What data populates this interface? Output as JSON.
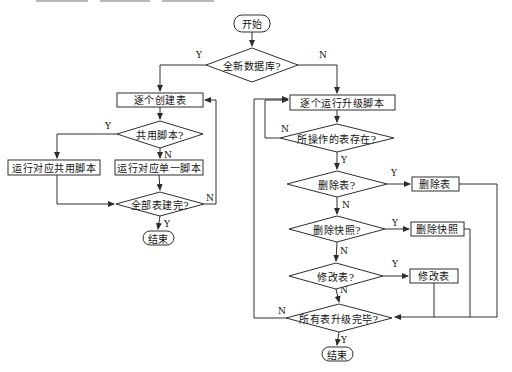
{
  "diagram": {
    "type": "flowchart",
    "nodes": {
      "start": {
        "label": "开始",
        "shape": "terminator"
      },
      "new_db": {
        "label": "全新数据库?",
        "shape": "decision"
      },
      "create_tables": {
        "label": "逐个创建表",
        "shape": "process"
      },
      "shared_script": {
        "label": "共用脚本?",
        "shape": "decision"
      },
      "run_shared": {
        "label": "运行对应共用脚本",
        "shape": "process"
      },
      "run_single": {
        "label": "运行对应单一脚本",
        "shape": "process"
      },
      "all_created": {
        "label": "全部表建完?",
        "shape": "decision"
      },
      "end_left": {
        "label": "结束",
        "shape": "terminator"
      },
      "run_upgrade": {
        "label": "逐个运行升级脚本",
        "shape": "process"
      },
      "table_exists": {
        "label": "所操作的表存在?",
        "shape": "decision"
      },
      "drop_table_q": {
        "label": "删除表?",
        "shape": "decision"
      },
      "drop_table": {
        "label": "删除表",
        "shape": "process"
      },
      "drop_snapshot_q": {
        "label": "删除快照?",
        "shape": "decision"
      },
      "drop_snapshot": {
        "label": "删除快照",
        "shape": "process"
      },
      "alter_table_q": {
        "label": "修改表?",
        "shape": "decision"
      },
      "alter_table": {
        "label": "修改表",
        "shape": "process"
      },
      "all_upgraded": {
        "label": "所有表升级完毕?",
        "shape": "decision"
      },
      "end_right": {
        "label": "结束",
        "shape": "terminator"
      }
    },
    "branch_labels": {
      "yes": "Y",
      "no": "N"
    },
    "colors": {
      "line": "#2e2e2e",
      "text": "#111111",
      "background": "#ffffff"
    }
  }
}
